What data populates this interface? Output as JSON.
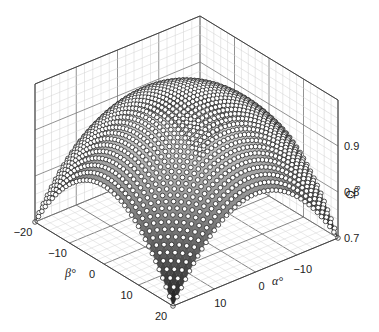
{
  "chart_data": {
    "type": "scatter3d-surface",
    "title": "",
    "xlabel": "α°",
    "ylabel": "β°",
    "zlabel": "Ω3",
    "x_ticks": [
      -10,
      0,
      10
    ],
    "x_tick_labels": [
      "−10",
      "0",
      "10"
    ],
    "y_ticks": [
      -20,
      -10,
      0,
      10,
      20
    ],
    "y_tick_labels": [
      "−20",
      "−10",
      "0",
      "10",
      "20"
    ],
    "z_ticks": [
      0.7,
      0.8,
      0.9
    ],
    "z_tick_labels": [
      "0.7",
      "0.8",
      "0.9"
    ],
    "xlim": [
      -20,
      20
    ],
    "ylim": [
      -20,
      20
    ],
    "zlim": [
      0.7,
      1.0
    ],
    "grid": true,
    "legend": null,
    "surface_model": "dome: maximum ≈1.0 at α=0,β=0; ≈0.87 at edge midpoints; ≈0.70–0.74 at corners",
    "sample_points": [
      {
        "alpha": 0,
        "beta": 0,
        "omega": 1.0
      },
      {
        "alpha": 20,
        "beta": 0,
        "omega": 0.87
      },
      {
        "alpha": 0,
        "beta": 20,
        "omega": 0.87
      },
      {
        "alpha": -20,
        "beta": 0,
        "omega": 0.87
      },
      {
        "alpha": 0,
        "beta": -20,
        "omega": 0.87
      },
      {
        "alpha": 20,
        "beta": 20,
        "omega": 0.7
      },
      {
        "alpha": 20,
        "beta": -20,
        "omega": 0.74
      },
      {
        "alpha": -20,
        "beta": 20,
        "omega": 0.73
      },
      {
        "alpha": -20,
        "beta": -20,
        "omega": 0.72
      }
    ],
    "grid_step_deg": 1,
    "marker": "open-circle",
    "colors": {
      "surface_high": "#f2f2f2",
      "surface_low": "#1a1a1a",
      "marker_fill": "#ffffff",
      "marker_edge": "#111111",
      "gridline": "#bbbbbb",
      "box_edge": "#444444"
    }
  }
}
